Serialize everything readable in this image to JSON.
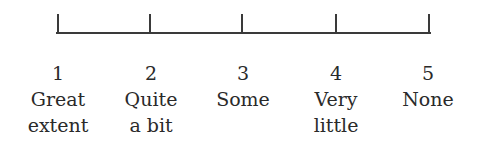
{
  "scale": {
    "points": [
      {
        "value": "1",
        "line1": "Great",
        "line2": "extent",
        "x": 58
      },
      {
        "value": "2",
        "line1": "Quite",
        "line2": "a bit",
        "x": 150
      },
      {
        "value": "3",
        "line1": "Some",
        "line2": "",
        "x": 242
      },
      {
        "value": "4",
        "line1": "Very",
        "line2": "little",
        "x": 336
      },
      {
        "value": "5",
        "line1": "None",
        "line2": "",
        "x": 429
      }
    ],
    "line_color": "#3a3a3a",
    "text_color": "#2a2a2a"
  }
}
